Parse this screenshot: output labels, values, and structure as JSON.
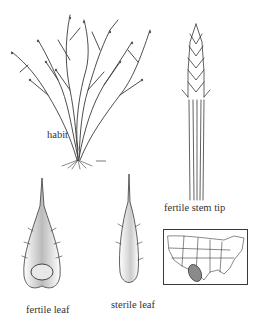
{
  "figure": {
    "panels": [
      {
        "id": "habit",
        "label": "habit"
      },
      {
        "id": "fertile-stem-tip",
        "label": "fertile stem tip"
      },
      {
        "id": "fertile-leaf",
        "label": "fertile leaf"
      },
      {
        "id": "sterile-leaf",
        "label": "sterile leaf"
      },
      {
        "id": "range-map",
        "label": ""
      }
    ],
    "map": {
      "region": "United States",
      "range_fill_color": "#8a8a8a",
      "outline_color": "#3a3a3a"
    }
  }
}
